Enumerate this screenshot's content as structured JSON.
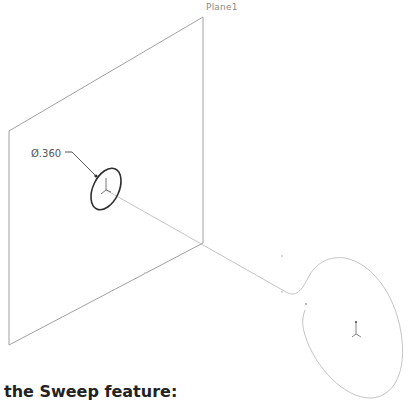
{
  "diagram": {
    "plane_label": "Plane1",
    "dimension_label": "Ø.360",
    "caption": "the Sweep feature:",
    "colors": {
      "plane_edges": "#9a9a9a",
      "profile_circle": "#333333",
      "path": "#c8c8c8",
      "caption": "#222222"
    }
  }
}
